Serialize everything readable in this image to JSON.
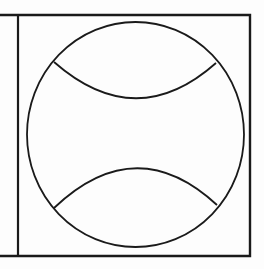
{
  "figure": {
    "title": "Baseball line drawing",
    "subject": "baseball",
    "stroke_color": "#1a1a1a",
    "background_color": "#fdfdfd",
    "frame": {
      "top_y": 15,
      "bottom_y": 256,
      "left_edge_x": 0,
      "divider_x": 18,
      "right_x": 250
    },
    "ball": {
      "cx": 135.5,
      "cy": 134.5,
      "rx": 108.5,
      "ry": 112.5
    },
    "seams": {
      "upper": {
        "start": [
          54,
          62
        ],
        "control": [
          136,
          134
        ],
        "end": [
          216,
          63
        ],
        "lowest_y": 98
      },
      "lower": {
        "start": [
          54,
          208
        ],
        "control": [
          136,
          130
        ],
        "end": [
          217,
          205
        ],
        "highest_y": 168
      }
    }
  }
}
